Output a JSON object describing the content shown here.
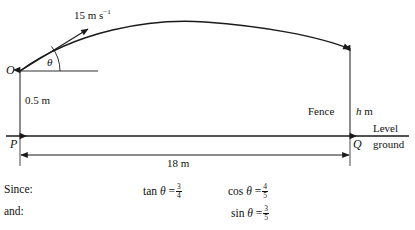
{
  "figure": {
    "labels": {
      "speed": "15 m s",
      "speed_exponent": "−1",
      "angle": "θ",
      "origin_point": "O",
      "initial_height": "0.5 m",
      "fence": "Fence",
      "fence_height": "h",
      "fence_height_unit": "m",
      "ground_point_left": "P",
      "ground_point_right": "Q",
      "ground_line_1": "Level",
      "ground_line_2": "ground",
      "horizontal_distance": "18 m"
    },
    "colors": {
      "line": "#1a1a1a",
      "text": "#111111",
      "background": "#ffffff"
    }
  },
  "working": {
    "rows": [
      {
        "lead": "Since:",
        "terms": [
          {
            "func": "tan",
            "angle": "θ",
            "eq": "=",
            "num": "3",
            "den": "4"
          },
          {
            "func": "cos",
            "angle": "θ",
            "eq": "=",
            "num": "4",
            "den": "5"
          }
        ]
      },
      {
        "lead": "and:",
        "terms": [
          {
            "func": "sin",
            "angle": "θ",
            "eq": "=",
            "num": "3",
            "den": "5"
          }
        ]
      }
    ],
    "lead_since": "Since:",
    "lead_and": "and:",
    "tan_label": "tan",
    "cos_label": "cos",
    "sin_label": "sin",
    "theta": "θ",
    "equals": "=",
    "tan_num": "3",
    "tan_den": "4",
    "cos_num": "4",
    "cos_den": "5",
    "sin_num": "3",
    "sin_den": "5"
  }
}
